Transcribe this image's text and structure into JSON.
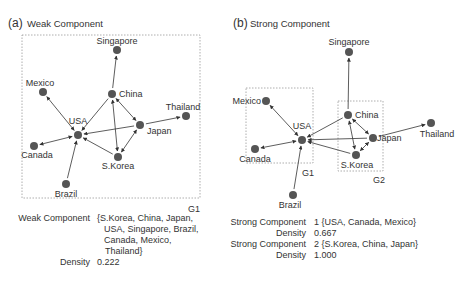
{
  "panel_a": {
    "letter": "(a)",
    "title": "Weak Component",
    "group_label": "G1",
    "nodes": {
      "singapore": "Singapore",
      "mexico": "Mexico",
      "china": "China",
      "thailand": "Thailand",
      "usa": "USA",
      "japan": "Japan",
      "canada": "Canada",
      "skorea": "S.Korea",
      "brazil": "Brazil"
    },
    "info": {
      "component_key": "Weak Component",
      "component_lines": [
        "{S.Korea, China, Japan,",
        "USA, Singapore, Brazil,",
        "Canada, Mexico,",
        "Thailand}"
      ],
      "density_key": "Density",
      "density_value": "0.222"
    }
  },
  "panel_b": {
    "letter": "(b)",
    "title": "Strong Component",
    "group1_label": "G1",
    "group2_label": "G2",
    "nodes": {
      "singapore": "Singapore",
      "mexico": "Mexico",
      "china": "China",
      "thailand": "Thailand",
      "usa": "USA",
      "japan": "Japan",
      "canada": "Canada",
      "skorea": "S.Korea",
      "brazil": "Brazil"
    },
    "info": {
      "component1_key": "Strong Component",
      "component1_value": "1 {USA, Canada, Mexico}",
      "density1_key": "Density",
      "density1_value": "0.667",
      "component2_key": "Strong Component",
      "component2_value": "2 {S.Korea, China, Japan}",
      "density2_key": "Density",
      "density2_value": "1.000"
    }
  },
  "edges": [
    {
      "from": "china",
      "to": "singapore",
      "dir": "forward"
    },
    {
      "from": "china",
      "to": "usa",
      "dir": "forward"
    },
    {
      "from": "usa",
      "to": "mexico",
      "dir": "both"
    },
    {
      "from": "usa",
      "to": "canada",
      "dir": "both"
    },
    {
      "from": "brazil",
      "to": "usa",
      "dir": "forward"
    },
    {
      "from": "japan",
      "to": "usa",
      "dir": "forward"
    },
    {
      "from": "skorea",
      "to": "usa",
      "dir": "forward"
    },
    {
      "from": "japan",
      "to": "thailand",
      "dir": "forward"
    },
    {
      "from": "china",
      "to": "japan",
      "dir": "both"
    },
    {
      "from": "china",
      "to": "skorea",
      "dir": "both"
    },
    {
      "from": "japan",
      "to": "skorea",
      "dir": "both"
    }
  ],
  "colors": {
    "node": "#555555",
    "edge": "#333333",
    "box": "#999999",
    "text": "#333333"
  }
}
